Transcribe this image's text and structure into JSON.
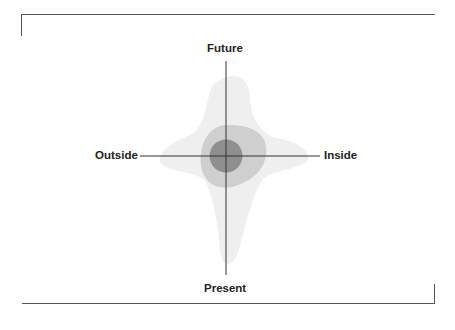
{
  "diagram": {
    "axes": {
      "top": "Future",
      "bottom": "Present",
      "left": "Outside",
      "right": "Inside"
    },
    "regions": [
      {
        "name": "outer-region",
        "shade": "lightest",
        "color": "#efefef"
      },
      {
        "name": "middle-region",
        "shade": "medium",
        "color": "#cfcfcf"
      },
      {
        "name": "inner-circle",
        "shade": "darkest",
        "color": "#8f8f8f"
      }
    ]
  }
}
